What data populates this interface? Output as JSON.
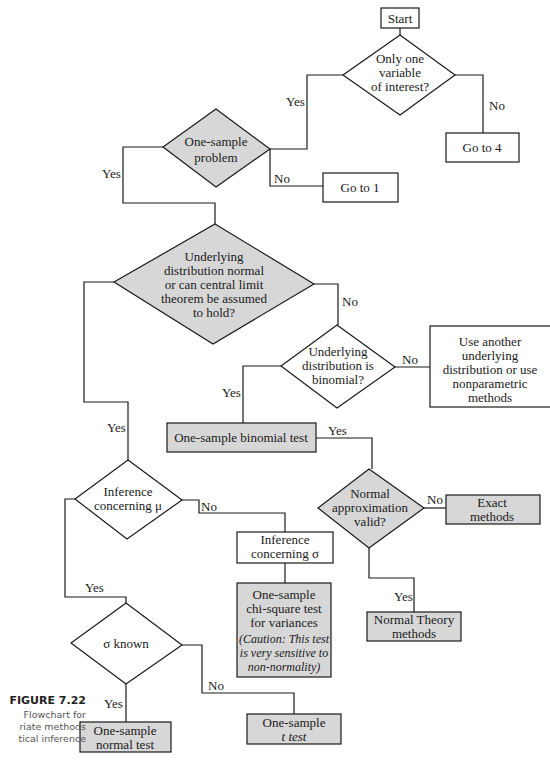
{
  "figure": {
    "title": "FIGURE 7.22",
    "caption_lines": [
      "Flowchart for",
      "riate methods",
      "tical inference"
    ]
  },
  "colors": {
    "shaded_fill": "#d7d7d7",
    "plain_fill": "#ffffff",
    "stroke": "#1a1a1a"
  },
  "nodes": {
    "start": {
      "lines": [
        "Start"
      ]
    },
    "only_one_variable": {
      "lines": [
        "Only one",
        "variable",
        "of interest?"
      ]
    },
    "go_to_4": {
      "lines": [
        "Go to 4"
      ]
    },
    "one_sample_problem": {
      "lines": [
        "One-sample",
        "problem"
      ]
    },
    "go_to_1": {
      "lines": [
        "Go to 1"
      ]
    },
    "underlying_normal": {
      "lines": [
        "Underlying",
        "distribution normal",
        "or can central limit",
        "theorem be assumed",
        "to hold?"
      ]
    },
    "underlying_binomial": {
      "lines": [
        "Underlying",
        "distribution is",
        "binomial?"
      ]
    },
    "use_another": {
      "lines": [
        "Use another",
        "underlying",
        "distribution or use",
        "nonparametric",
        "methods"
      ]
    },
    "binomial_test": {
      "lines": [
        "One-sample binomial test"
      ]
    },
    "normal_approx": {
      "lines": [
        "Normal",
        "approximation",
        "valid?"
      ]
    },
    "exact_methods": {
      "lines": [
        "Exact",
        "methods"
      ]
    },
    "normal_theory": {
      "lines": [
        "Normal Theory",
        "methods"
      ]
    },
    "inference_mu": {
      "lines": [
        "Inference",
        "concerning μ"
      ]
    },
    "inference_sigma": {
      "lines": [
        "Inference",
        "concerning σ"
      ]
    },
    "chi_square": {
      "lines": [
        "One-sample",
        "chi-square test",
        "for variances"
      ],
      "note_lines": [
        "(Caution: This test",
        "is very sensitive to",
        "non-normality)"
      ]
    },
    "sigma_known": {
      "lines": [
        "σ known"
      ]
    },
    "normal_test": {
      "lines": [
        "One-sample",
        "normal test"
      ]
    },
    "t_test": {
      "lines": [
        "One-sample",
        "t test"
      ]
    }
  },
  "edge_labels": {
    "only_one_yes": "Yes",
    "only_one_no": "No",
    "one_sample_yes": "Yes",
    "one_sample_no": "No",
    "normal_no": "No",
    "normal_yes": "Yes",
    "binomial_no": "No",
    "binomial_yes": "Yes",
    "binomial_test_yes": "Yes",
    "approx_no": "No",
    "approx_yes": "Yes",
    "mu_no": "No",
    "mu_yes": "Yes",
    "sigma_known_yes": "Yes",
    "sigma_known_no": "No"
  }
}
